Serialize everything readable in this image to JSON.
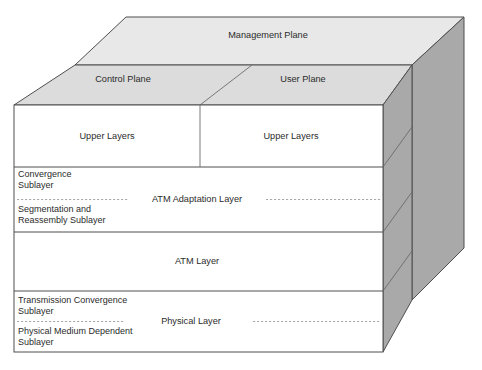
{
  "figure": {
    "caption": ""
  },
  "colors": {
    "top_face": "#e8e8e8",
    "plane_face": "#dcdcdc",
    "side_face": "#a9a9a9",
    "side_face_dark": "#9d9d9d",
    "front_face": "#ffffff",
    "outline": "#4f4f4f",
    "text": "#2b2b2b",
    "dashed": "#9a9a9a"
  },
  "planes": {
    "management": {
      "label": "Management Plane"
    },
    "control": {
      "label": "Control Plane"
    },
    "user": {
      "label": "User Plane"
    }
  },
  "front_rows": [
    {
      "id": "upper-layers",
      "columns": [
        {
          "label": "Upper Layers"
        },
        {
          "label": "Upper Layers"
        }
      ]
    },
    {
      "id": "atm-adaptation-layer",
      "center_label": "ATM Adaptation Layer",
      "sublayers": [
        {
          "lines": [
            "Convergence",
            "Sublayer"
          ]
        },
        {
          "lines": [
            "Segmentation and",
            "Reassembly Sublayer"
          ]
        }
      ]
    },
    {
      "id": "atm-layer",
      "center_label": "ATM Layer",
      "sublayers": []
    },
    {
      "id": "physical-layer",
      "center_label": "Physical Layer",
      "sublayers": [
        {
          "lines": [
            "Transmission Convergence",
            "Sublayer"
          ]
        },
        {
          "lines": [
            "Physical Medium Dependent",
            "Sublayer"
          ]
        }
      ]
    }
  ]
}
